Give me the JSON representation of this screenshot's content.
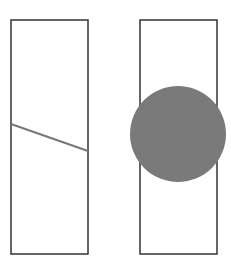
{
  "canvas": {
    "width": 231,
    "height": 265,
    "background": "#ffffff"
  },
  "panels": [
    {
      "name": "left-panel",
      "rect": {
        "x": 11,
        "y": 20,
        "width": 77,
        "height": 234,
        "stroke": "#333333",
        "stroke_width": 1.5
      },
      "line": {
        "x1": 11,
        "y1": 124,
        "x2": 88,
        "y2": 151,
        "stroke": "#777777",
        "stroke_width": 2
      }
    },
    {
      "name": "right-panel",
      "rect": {
        "x": 140,
        "y": 20,
        "width": 77,
        "height": 234,
        "stroke": "#333333",
        "stroke_width": 1.5
      },
      "circle": {
        "cx": 178,
        "cy": 134,
        "r": 48,
        "fill": "#7a7a7a"
      }
    }
  ]
}
